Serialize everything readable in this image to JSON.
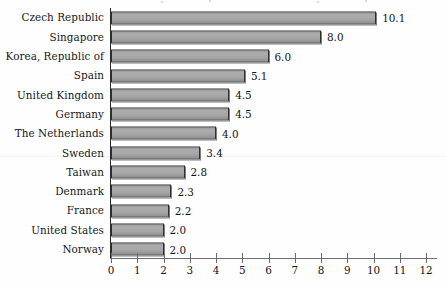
{
  "chart_data": {
    "type": "bar",
    "orientation": "horizontal",
    "title": "",
    "xlabel": "",
    "ylabel": "",
    "grid": false,
    "legend": false,
    "xlim": [
      0,
      12
    ],
    "xticks": [
      "0",
      "1",
      "2",
      "3",
      "4",
      "5",
      "6",
      "7",
      "8",
      "9",
      "10",
      "11",
      "12"
    ],
    "categories": [
      "Czech Republic",
      "Singapore",
      "Korea, Republic of",
      "Spain",
      "United Kingdom",
      "Germany",
      "The Netherlands",
      "Sweden",
      "Taiwan",
      "Denmark",
      "France",
      "United States",
      "Norway"
    ],
    "values": [
      10.1,
      8.0,
      6.0,
      5.1,
      4.5,
      4.5,
      4.0,
      3.4,
      2.8,
      2.3,
      2.2,
      2.0,
      2.0
    ],
    "value_labels": [
      "10.1",
      "8.0",
      "6.0",
      "5.1",
      "4.5",
      "4.5",
      "4.0",
      "3.4",
      "2.8",
      "2.3",
      "2.2",
      "2.0",
      "2.0"
    ],
    "bars": [
      {
        "category": "Czech Republic",
        "value": 10.1,
        "label": "10.1"
      },
      {
        "category": "Singapore",
        "value": 8.0,
        "label": "8.0"
      },
      {
        "category": "Korea, Republic of",
        "value": 6.0,
        "label": "6.0"
      },
      {
        "category": "Spain",
        "value": 5.1,
        "label": "5.1"
      },
      {
        "category": "United Kingdom",
        "value": 4.5,
        "label": "4.5"
      },
      {
        "category": "Germany",
        "value": 4.5,
        "label": "4.5"
      },
      {
        "category": "The Netherlands",
        "value": 4.0,
        "label": "4.0"
      },
      {
        "category": "Sweden",
        "value": 3.4,
        "label": "3.4"
      },
      {
        "category": "Taiwan",
        "value": 2.8,
        "label": "2.8"
      },
      {
        "category": "Denmark",
        "value": 2.3,
        "label": "2.3"
      },
      {
        "category": "France",
        "value": 2.2,
        "label": "2.2"
      },
      {
        "category": "United States",
        "value": 2.0,
        "label": "2.0"
      },
      {
        "category": "Norway",
        "value": 2.0,
        "label": "2.0"
      }
    ],
    "colors": {
      "bar_fill": "#a6a6a6",
      "bar_border": "#2f2f2f",
      "axis": "#2b2b2b",
      "text": "#141414",
      "background": "#ffffff"
    }
  }
}
